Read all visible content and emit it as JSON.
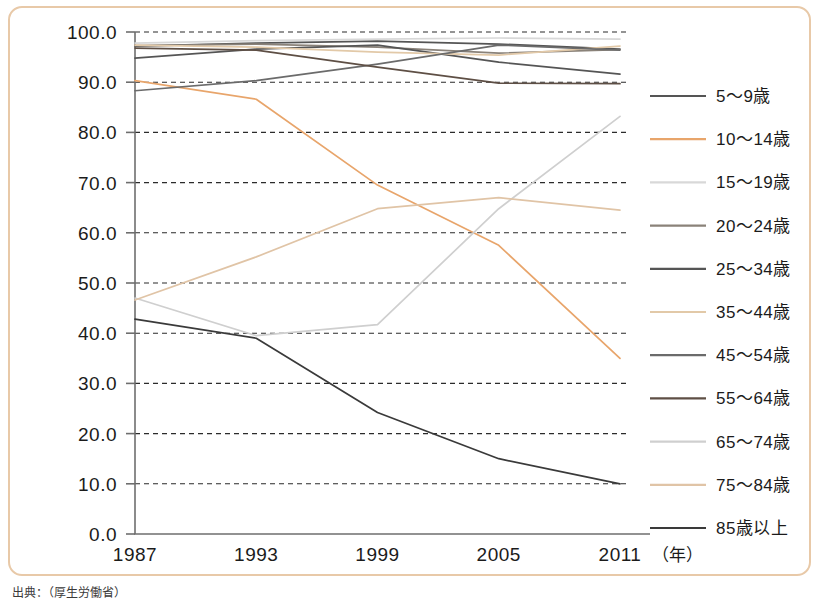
{
  "chart_data": {
    "type": "line",
    "title": "",
    "xlabel": "（年）",
    "ylabel": "",
    "x": [
      1987,
      1993,
      1999,
      2005,
      2011
    ],
    "categories": [
      "1987",
      "1993",
      "1999",
      "2005",
      "2011"
    ],
    "xtick_labels": [
      "1987",
      "1993",
      "1999",
      "2005",
      "2011"
    ],
    "ytick_labels": [
      "0.0",
      "10.0",
      "20.0",
      "30.0",
      "40.0",
      "50.0",
      "60.0",
      "70.0",
      "80.0",
      "90.0",
      "100.0"
    ],
    "ytick_values": [
      0,
      10,
      20,
      30,
      40,
      50,
      60,
      70,
      80,
      90,
      100
    ],
    "ylim": [
      0,
      100
    ],
    "xlim": [
      1987,
      2011
    ],
    "grid": true,
    "legend_position": "right",
    "series": [
      {
        "name": "5～9歳",
        "color": "#555555",
        "values": [
          97.2,
          97.8,
          98.2,
          97.6,
          96.6
        ]
      },
      {
        "name": "10～14歳",
        "color": "#e8a56b",
        "values": [
          90.3,
          86.6,
          69.5,
          57.5,
          35.0
        ]
      },
      {
        "name": "15～19歳",
        "color": "#d8d8d8",
        "values": [
          97.8,
          98.3,
          98.6,
          98.8,
          98.6
        ]
      },
      {
        "name": "20～24歳",
        "color": "#8a8279",
        "values": [
          97.3,
          97.6,
          97.0,
          95.8,
          96.5
        ]
      },
      {
        "name": "25～34歳",
        "color": "#555555",
        "values": [
          94.8,
          96.6,
          97.4,
          94.0,
          91.6
        ]
      },
      {
        "name": "35～44歳",
        "color": "#e2c9a8",
        "values": [
          97.4,
          97.0,
          96.0,
          95.4,
          97.2
        ]
      },
      {
        "name": "45～54歳",
        "color": "#6b6b6b",
        "values": [
          88.3,
          90.3,
          93.6,
          97.4,
          96.4
        ]
      },
      {
        "name": "55～64歳",
        "color": "#5e4f45",
        "values": [
          96.8,
          96.4,
          93.0,
          89.8,
          89.7
        ]
      },
      {
        "name": "65～74歳",
        "color": "#cfcfcf",
        "values": [
          47.0,
          39.5,
          41.7,
          64.8,
          83.2
        ]
      },
      {
        "name": "75～84歳",
        "color": "#e0c4a6",
        "values": [
          46.6,
          55.2,
          64.8,
          67.0,
          64.5
        ]
      },
      {
        "name": "85歳以上",
        "color": "#3a3a3a",
        "values": [
          42.8,
          39.0,
          24.2,
          15.0,
          10.0
        ]
      }
    ]
  },
  "axes": {
    "x_unit_label": "（年）"
  },
  "legend": {
    "items": [
      {
        "label": "5～9歳"
      },
      {
        "label": "10～14歳"
      },
      {
        "label": "15～19歳"
      },
      {
        "label": "20～24歳"
      },
      {
        "label": "25～34歳"
      },
      {
        "label": "35～44歳"
      },
      {
        "label": "45～54歳"
      },
      {
        "label": "55～64歳"
      },
      {
        "label": "65～74歳"
      },
      {
        "label": "75～84歳"
      },
      {
        "label": "85歳以上"
      }
    ]
  },
  "colors": {
    "frame_border": "#e8c9a8",
    "gridline": "#2b2b2b",
    "axis": "#6e6e6e",
    "background": "#ffffff",
    "text": "#1b1b1b"
  },
  "source_note": "出典：（厚生労働省）"
}
